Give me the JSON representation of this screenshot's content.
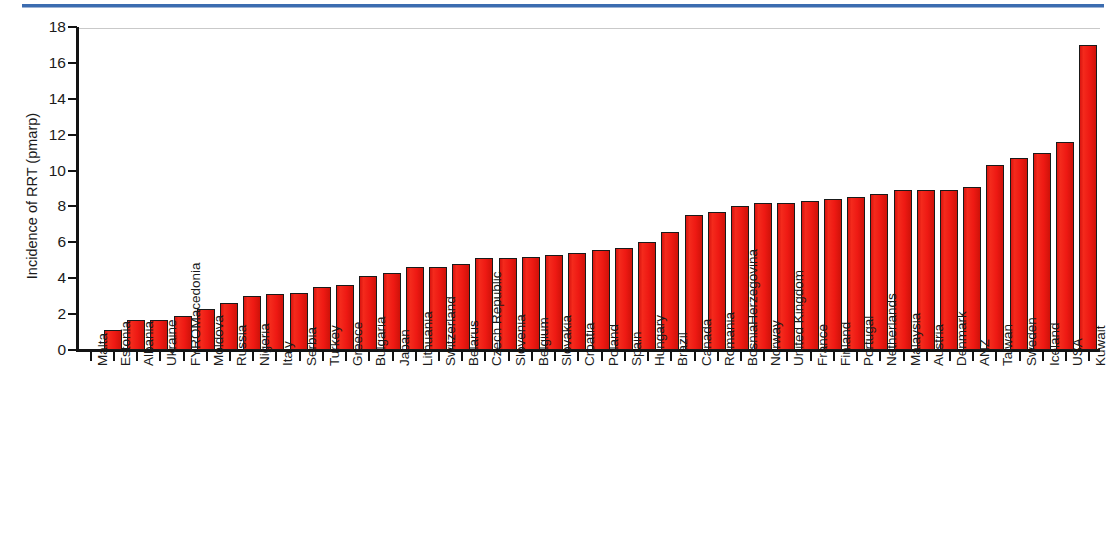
{
  "figure": {
    "accent_rule_color": "#3b6cb0",
    "bar_color": "#ee1c15",
    "bar_edge_color": "#1a1a1a"
  },
  "chart_data": {
    "type": "bar",
    "title": "",
    "xlabel": "",
    "ylabel": "Incidence of RRT (pmarp)",
    "ylim": [
      0,
      18
    ],
    "yticks": [
      0,
      2,
      4,
      6,
      8,
      10,
      12,
      14,
      16,
      18
    ],
    "ytick_labels": [
      "0",
      "2",
      "4",
      "6",
      "8",
      "10",
      "12",
      "14",
      "16",
      "18"
    ],
    "grid": false,
    "legend": null,
    "categories": [
      "Malta",
      "Estonia",
      "Albania",
      "Ukraine",
      "FYROMacedonia",
      "Moldova",
      "Russia",
      "Nigeria",
      "Italy",
      "Serbia",
      "Turkey",
      "Greece",
      "Bulgaria",
      "Japan",
      "Lithuania",
      "Switzerland",
      "Belarus",
      "Czech Republic",
      "Slovenia",
      "Belgium",
      "Slovakia",
      "Croatia",
      "Poland",
      "Spain",
      "Hungary",
      "Brazil",
      "Canada",
      "Romania",
      "BosniaHerzegovina",
      "Norway",
      "United Kingdom",
      "France",
      "Finland",
      "Portugal",
      "Netherlands",
      "Malaysia",
      "Austria",
      "Denmark",
      "ANZ",
      "Taiwan",
      "Sweden",
      "Iceland",
      "USA",
      "Kuwait"
    ],
    "values": [
      0,
      1.1,
      1.7,
      1.7,
      1.9,
      2.3,
      2.6,
      3.0,
      3.1,
      3.2,
      3.5,
      3.6,
      4.1,
      4.3,
      4.6,
      4.6,
      4.8,
      5.1,
      5.1,
      5.2,
      5.3,
      5.4,
      5.6,
      5.7,
      6.0,
      6.6,
      7.5,
      7.7,
      8.0,
      8.2,
      8.2,
      8.3,
      8.4,
      8.5,
      8.7,
      8.9,
      8.9,
      8.9,
      9.1,
      10.3,
      10.7,
      11.0,
      11.6,
      17.0
    ]
  }
}
